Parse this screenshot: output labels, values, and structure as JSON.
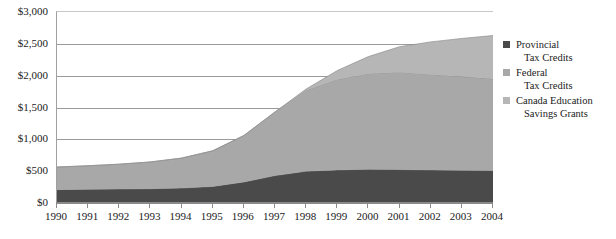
{
  "chart_data": {
    "type": "area",
    "stacked": true,
    "title": "",
    "subtitle": "",
    "xlabel": "",
    "ylabel": "",
    "categories": [
      "1990",
      "1991",
      "1992",
      "1993",
      "1994",
      "1995",
      "1996",
      "1997",
      "1998",
      "1999",
      "2000",
      "2001",
      "2002",
      "2003",
      "2004"
    ],
    "x": [
      1990,
      1991,
      1992,
      1993,
      1994,
      1995,
      1996,
      1997,
      1998,
      1999,
      2000,
      2001,
      2002,
      2003,
      2004
    ],
    "series": [
      {
        "name": "Provincial Tax Credits",
        "color": "#4a4a4a",
        "values": [
          210,
          215,
          220,
          225,
          235,
          260,
          330,
          430,
          500,
          520,
          530,
          525,
          520,
          515,
          510
        ]
      },
      {
        "name": "Federal Tax Credits",
        "color": "#a8a8a8",
        "values": [
          355,
          370,
          390,
          420,
          470,
          560,
          730,
          1000,
          1270,
          1420,
          1500,
          1530,
          1500,
          1470,
          1440
        ]
      },
      {
        "name": "Canada Education Savings Grants",
        "color": "#b6b6b6",
        "values": [
          0,
          0,
          0,
          0,
          0,
          0,
          0,
          0,
          20,
          140,
          270,
          400,
          510,
          600,
          680
        ]
      }
    ],
    "totals": [
      565,
      585,
      610,
      645,
      705,
      820,
      1060,
      1430,
      1790,
      2080,
      2300,
      2455,
      2530,
      2585,
      2630
    ],
    "ylim": [
      0,
      3000
    ],
    "yticks": [
      0,
      500,
      1000,
      1500,
      2000,
      2500,
      3000
    ],
    "ytick_labels": [
      "$0",
      "$500",
      "$1,000",
      "$1,500",
      "$2,000",
      "$2,500",
      "$3,000"
    ],
    "grid": true,
    "legend_position": "right",
    "legend": [
      {
        "label_line1": "Provincial",
        "label_line2": "Tax Credits",
        "color": "#4a4a4a"
      },
      {
        "label_line1": "Federal",
        "label_line2": "Tax Credits",
        "color": "#a8a8a8"
      },
      {
        "label_line1": "Canada Education",
        "label_line2": "Savings Grants",
        "color": "#b6b6b6"
      }
    ]
  }
}
